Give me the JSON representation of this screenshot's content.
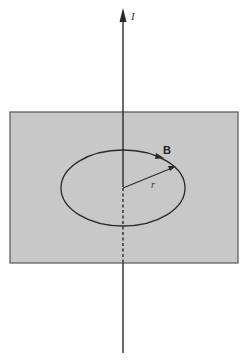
{
  "diagram": {
    "type": "physics-illustration",
    "labels": {
      "current": "I",
      "field": "B",
      "radius": "r"
    },
    "colors": {
      "plane_fill": "#c8c8c8",
      "plane_stroke": "#555555",
      "line": "#2a2a2a",
      "background": "#ffffff"
    }
  }
}
